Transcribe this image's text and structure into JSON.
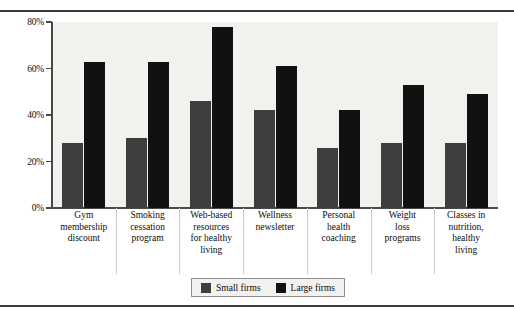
{
  "chart_data": {
    "type": "bar",
    "title": "",
    "xlabel": "",
    "ylabel": "",
    "ylim": [
      0,
      80
    ],
    "yticks": [
      0,
      20,
      40,
      60,
      80
    ],
    "ytick_labels": [
      "0%",
      "20%",
      "40%",
      "60%",
      "80%"
    ],
    "grid": false,
    "legend_position": "bottom-center",
    "categories": [
      "Gym membership discount",
      "Smoking cessation program",
      "Web-based resources for healthy living",
      "Wellness newsletter",
      "Personal health coaching",
      "Weight loss programs",
      "Classes in nutrition, healthy living"
    ],
    "category_lines": [
      [
        "Gym",
        "membership",
        "discount"
      ],
      [
        "Smoking",
        "cessation",
        "program"
      ],
      [
        "Web-based",
        "resources",
        "for healthy",
        "living"
      ],
      [
        "Wellness",
        "newsletter"
      ],
      [
        "Personal",
        "health",
        "coaching"
      ],
      [
        "Weight",
        "loss",
        "programs"
      ],
      [
        "Classes in",
        "nutrition,",
        "healthy",
        "living"
      ]
    ],
    "series": [
      {
        "name": "Small firms",
        "color": "#3e3e3e",
        "values": [
          28,
          30,
          46,
          42,
          26,
          28,
          28
        ]
      },
      {
        "name": "Large firms",
        "color": "#111111",
        "values": [
          63,
          63,
          78,
          61,
          42,
          53,
          49
        ]
      }
    ]
  },
  "legend": {
    "items": [
      {
        "label": "Small firms",
        "color": "#3e3e3e"
      },
      {
        "label": "Large firms",
        "color": "#111111"
      }
    ]
  },
  "colors": {
    "small_firms": "#3e3e3e",
    "large_firms": "#111111",
    "plot_background": "#f2f1ee",
    "axis": "#4a4a4a",
    "rule": "#3a3a3a"
  }
}
